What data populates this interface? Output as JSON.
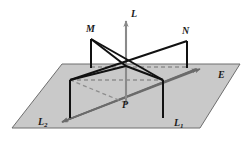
{
  "figure": {
    "background_color": "#ffffff",
    "plane": {
      "name": "E",
      "label": "E",
      "fill_color": "#c9c9c9",
      "edge_color": "#6e6e6e",
      "vertices": "12,128 62,64 240,64 200,128"
    },
    "labels": {
      "vertical_line": "L",
      "point_m": "M",
      "point_n": "N",
      "point_p": "P",
      "line_1": "L",
      "line_1_sub": "1",
      "line_2": "L",
      "line_2_sub": "2",
      "plane": "E"
    },
    "colors": {
      "solid_line": "#111111",
      "plane_line": "#6b6b6b",
      "dashed_line": "#8e8e8e",
      "plane_fill": "#c9c9c9",
      "plane_edge": "#6e6e6e",
      "label_text": "#1a1a1a"
    },
    "geometry": {
      "intersection_point": "126,66",
      "vertical_line_top": "126,18",
      "vertical_line_bottom": "126,120",
      "point_m_coords": "91,39",
      "point_n_coords": "187,41",
      "m_foot": "91,68",
      "n_foot": "187,68",
      "left_leg_end": "70,80",
      "right_leg_end": "163,80",
      "left_leg_foot": "70,118",
      "right_leg_foot": "163,118",
      "line1_arrow_start": "62,122",
      "line1_arrow_end": "202,68",
      "line2_arrow_start": "196,68",
      "line2_arrow_end": "60,123"
    }
  }
}
